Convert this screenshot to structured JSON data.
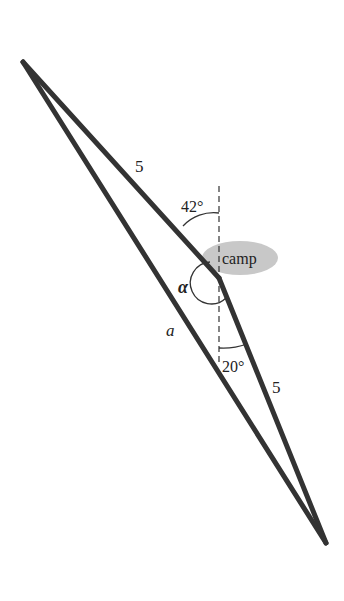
{
  "diagram": {
    "type": "triangle-navigation",
    "vertices": {
      "start": {
        "x": 23,
        "y": 62
      },
      "camp": {
        "x": 219,
        "y": 278
      },
      "end": {
        "x": 326,
        "y": 543
      }
    },
    "labels": {
      "side_start_camp": "5",
      "side_camp_end": "5",
      "side_unknown": "a",
      "angle_top": "42°",
      "angle_bottom": "20°",
      "angle_alpha": "α",
      "camp": "camp"
    },
    "colors": {
      "line": "#333333",
      "camp_ellipse": "#c8c8c8",
      "text": "#222222"
    }
  }
}
